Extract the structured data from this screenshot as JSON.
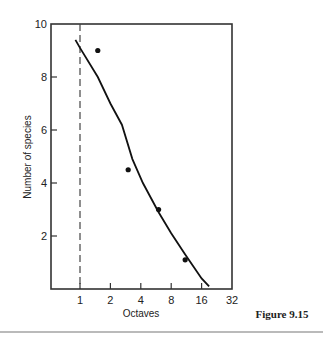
{
  "figure": {
    "caption": "Figure 9.15"
  },
  "chart_data": {
    "type": "scatter",
    "title": "",
    "xlabel": "Octaves",
    "ylabel": "Number of species",
    "x_scale": "log2",
    "xlim": [
      0.5,
      32
    ],
    "ylim": [
      0,
      10
    ],
    "x_ticks": [
      1,
      2,
      4,
      8,
      16,
      32
    ],
    "x_tick_labels": [
      "1",
      "2",
      "4",
      "8",
      "16",
      "32"
    ],
    "y_ticks": [
      2,
      4,
      6,
      8,
      10
    ],
    "y_tick_labels": [
      "2",
      "4",
      "6",
      "8",
      "10"
    ],
    "grid": false,
    "legend": null,
    "reference_line": {
      "orientation": "vertical",
      "x": 1,
      "style": "dashed"
    },
    "series": [
      {
        "name": "observed",
        "kind": "points",
        "x": [
          1.5,
          3,
          6,
          11
        ],
        "y": [
          9.0,
          4.5,
          3.0,
          1.1
        ]
      },
      {
        "name": "fitted curve",
        "kind": "line",
        "x": [
          0.9,
          1.0,
          1.5,
          2.0,
          2.6,
          3.3,
          4.2,
          6.0,
          8.0,
          11.0,
          16.0,
          19.0
        ],
        "y": [
          9.4,
          9.1,
          8.0,
          7.0,
          6.2,
          4.9,
          4.0,
          2.9,
          2.1,
          1.3,
          0.4,
          0.1
        ]
      }
    ]
  }
}
